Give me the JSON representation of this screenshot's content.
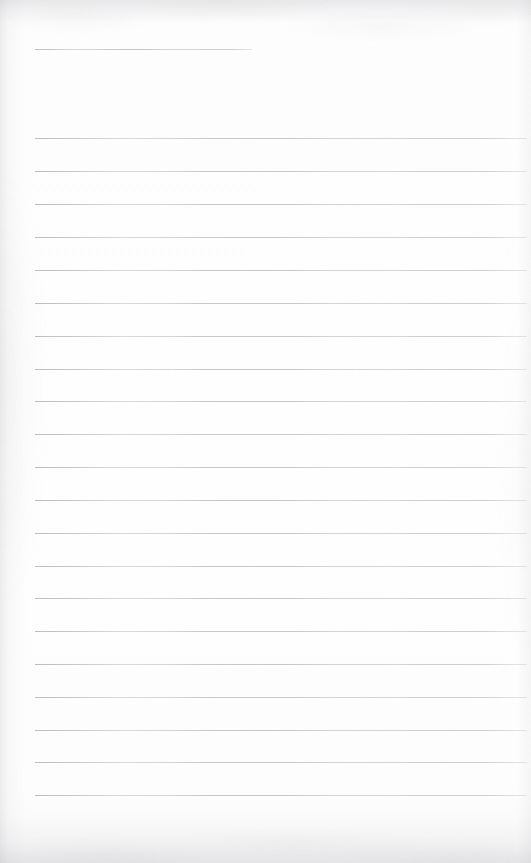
{
  "document": {
    "kind": "scanned-lined-notepad-page",
    "page_label": "Blank lined page",
    "content_text": "",
    "alt_text": "A blank scanned page of lined notepad paper with no handwriting or printed text",
    "page_width_px": 531,
    "page_height_px": 863
  },
  "paper": {
    "background_color": "#fdfdfd",
    "edge_shadow_color": "#a8a8ac",
    "rule_color": "#92949a",
    "rule_thickness_px": 1
  },
  "ruling": {
    "left_margin_px": 35,
    "right_edge_px": 527,
    "line_spacing_px": 32.85,
    "header_rule_end_px": 252,
    "line_count": 22,
    "lines": [
      {
        "id": "rule-1",
        "y": 49,
        "x_start": 35,
        "x_end": 252,
        "short": true
      },
      {
        "id": "rule-2",
        "y": 138,
        "x_start": 35,
        "x_end": 527,
        "short": false
      },
      {
        "id": "rule-3",
        "y": 171,
        "x_start": 35,
        "x_end": 527,
        "short": false
      },
      {
        "id": "rule-4",
        "y": 204,
        "x_start": 35,
        "x_end": 527,
        "short": false
      },
      {
        "id": "rule-5",
        "y": 237,
        "x_start": 35,
        "x_end": 527,
        "short": false
      },
      {
        "id": "rule-6",
        "y": 270,
        "x_start": 35,
        "x_end": 527,
        "short": false
      },
      {
        "id": "rule-7",
        "y": 303,
        "x_start": 35,
        "x_end": 527,
        "short": false
      },
      {
        "id": "rule-8",
        "y": 336,
        "x_start": 35,
        "x_end": 527,
        "short": false
      },
      {
        "id": "rule-9",
        "y": 369,
        "x_start": 35,
        "x_end": 527,
        "short": false
      },
      {
        "id": "rule-10",
        "y": 401,
        "x_start": 35,
        "x_end": 527,
        "short": false
      },
      {
        "id": "rule-11",
        "y": 434,
        "x_start": 35,
        "x_end": 527,
        "short": false
      },
      {
        "id": "rule-12",
        "y": 467,
        "x_start": 35,
        "x_end": 527,
        "short": false
      },
      {
        "id": "rule-13",
        "y": 500,
        "x_start": 35,
        "x_end": 527,
        "short": false
      },
      {
        "id": "rule-14",
        "y": 533,
        "x_start": 35,
        "x_end": 527,
        "short": false
      },
      {
        "id": "rule-15",
        "y": 566,
        "x_start": 35,
        "x_end": 527,
        "short": false
      },
      {
        "id": "rule-16",
        "y": 598,
        "x_start": 35,
        "x_end": 527,
        "short": false
      },
      {
        "id": "rule-17",
        "y": 631,
        "x_start": 35,
        "x_end": 527,
        "short": false
      },
      {
        "id": "rule-18",
        "y": 664,
        "x_start": 35,
        "x_end": 527,
        "short": false
      },
      {
        "id": "rule-19",
        "y": 697,
        "x_start": 35,
        "x_end": 527,
        "short": false
      },
      {
        "id": "rule-20",
        "y": 730,
        "x_start": 35,
        "x_end": 527,
        "short": false
      },
      {
        "id": "rule-21",
        "y": 762,
        "x_start": 35,
        "x_end": 527,
        "short": false
      },
      {
        "id": "rule-22",
        "y": 795,
        "x_start": 35,
        "x_end": 527,
        "short": false
      }
    ]
  }
}
